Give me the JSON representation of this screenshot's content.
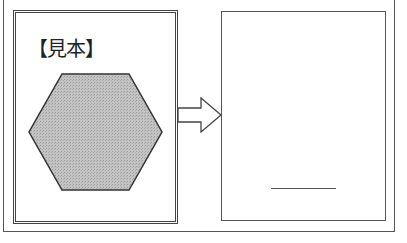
{
  "diagram": {
    "sample": {
      "label": "【見本】",
      "shape": "hexagon",
      "fill_color": "#b8b8b8",
      "stroke_color": "#333333"
    },
    "arrow": {
      "icon": "right-arrow-icon",
      "direction": "right"
    },
    "answer_box": {
      "content": "",
      "answer_line": "blank-line"
    },
    "colors": {
      "line": "#555555",
      "background": "#ffffff"
    }
  }
}
